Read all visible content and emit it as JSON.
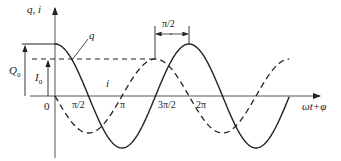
{
  "diagram": {
    "y_axis_label": "q, i",
    "x_axis_label": "ωt+φ",
    "origin_label": "0",
    "curve_q_label": "q",
    "curve_i_label": "i",
    "amplitude_q_label": "Q",
    "amplitude_q_sub": "0",
    "amplitude_i_label": "I",
    "amplitude_i_sub": "0",
    "phase_shift_label": "π/2",
    "x_ticks": [
      "π/2",
      "π",
      "3π/2",
      "2π"
    ],
    "colors": {
      "line": "#222222",
      "axis": "#444444",
      "background": "#ffffff"
    },
    "curves": [
      {
        "name": "q",
        "style": "solid",
        "formula": "Q0·cos(ωt+φ)"
      },
      {
        "name": "i",
        "style": "dashed",
        "formula": "-I0·sin(ωt+φ)"
      }
    ]
  }
}
